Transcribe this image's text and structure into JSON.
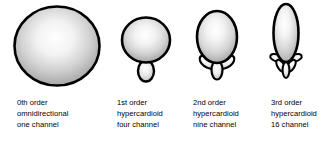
{
  "figure": {
    "background_color": "#ffffff",
    "outline_color": "#000000",
    "lobe_fill_center_color": "#ffffff",
    "lobe_fill_edge_color": "#9a9a9a"
  },
  "patterns": [
    {
      "id": "order-0",
      "order_label": "0th order",
      "pattern_label": "omnidirectional",
      "channel_label": "one channel",
      "main_lobe": {
        "width": 84,
        "height": 78
      },
      "side_lobe_count": 0
    },
    {
      "id": "order-1",
      "order_label": "1st order",
      "pattern_label": "hypercardioid",
      "channel_label": "four channel",
      "main_lobe": {
        "width": 48,
        "height": 45
      },
      "side_lobe_count": 1
    },
    {
      "id": "order-2",
      "order_label": "2nd order",
      "pattern_label": "hypercardioid",
      "channel_label": "nine channel",
      "main_lobe": {
        "width": 40,
        "height": 52
      },
      "side_lobe_count": 3
    },
    {
      "id": "order-3",
      "order_label": "3rd order",
      "pattern_label": "hypercardioid",
      "channel_label": "16 channel",
      "main_lobe": {
        "width": 25,
        "height": 58
      },
      "side_lobe_count": 5
    }
  ]
}
